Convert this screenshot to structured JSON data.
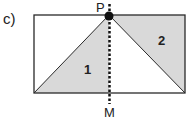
{
  "figure_label": "c)",
  "points": {
    "top": "P",
    "bottom": "M"
  },
  "regions": [
    "1",
    "2"
  ],
  "colors": {
    "shade": "#d9d9d9",
    "line": "#2a2a2a"
  }
}
